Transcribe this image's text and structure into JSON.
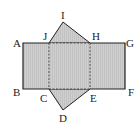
{
  "diagram": {
    "type": "net-of-triangular-prism",
    "labels": {
      "A": "A",
      "B": "B",
      "C": "C",
      "D": "D",
      "E": "E",
      "F": "F",
      "G": "G",
      "H": "H",
      "I": "I",
      "J": "J"
    },
    "colors": {
      "fill": "#c8c8c8",
      "stroke": "#222222",
      "background": "#ffffff"
    }
  }
}
